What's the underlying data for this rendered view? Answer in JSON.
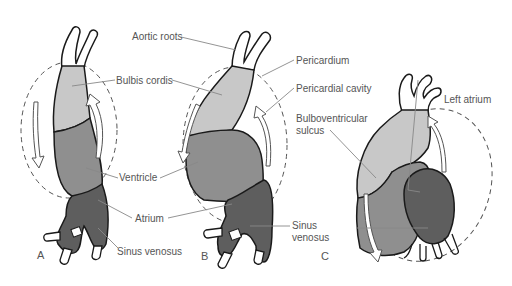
{
  "diagram": {
    "panels": [
      {
        "id": "A",
        "letter": "A"
      },
      {
        "id": "B",
        "letter": "B"
      },
      {
        "id": "C",
        "letter": "C"
      }
    ],
    "labels": {
      "aortic_roots": "Aortic roots",
      "bulbis_cordis": "Bulbis cordis",
      "ventricle": "Ventricle",
      "atrium": "Atrium",
      "sinus_venosus_a": "Sinus venosus",
      "pericardium": "Pericardium",
      "pericardial_cavity": "Pericardial cavity",
      "bulboventricular_line1": "Bulboventricular",
      "bulboventricular_line2": "sulcus",
      "sinus_venosus_b_line1": "Sinus",
      "sinus_venosus_b_line2": "venosus",
      "left_atrium": "Left atrium"
    },
    "colors": {
      "bulbus": "#c8c8c8",
      "ventricle": "#8f8f8f",
      "atrium": "#5e5e5e",
      "outline": "#1a1a1a",
      "leader": "#888888",
      "text": "#555555",
      "vessel": "#ffffff"
    }
  }
}
